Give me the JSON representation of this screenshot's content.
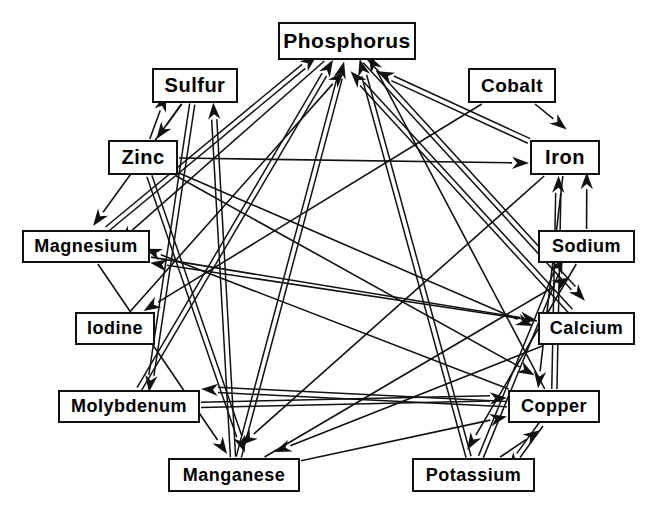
{
  "diagram": {
    "type": "directed-graph",
    "background_color": "#ffffff",
    "line_color": "#111111",
    "box_border_color": "#111111",
    "box_fill_color": "#ffffff"
  },
  "nodes": [
    {
      "id": "phosphorus",
      "label": "Phosphorus",
      "x": 278,
      "y": 22,
      "w": 138,
      "h": 38,
      "font_size": 21
    },
    {
      "id": "sulfur",
      "label": "Sulfur",
      "x": 152,
      "y": 68,
      "w": 86,
      "h": 35,
      "font_size": 20
    },
    {
      "id": "cobalt",
      "label": "Cobalt",
      "x": 468,
      "y": 68,
      "w": 88,
      "h": 35,
      "font_size": 19
    },
    {
      "id": "zinc",
      "label": "Zinc",
      "x": 108,
      "y": 140,
      "w": 70,
      "h": 35,
      "font_size": 20
    },
    {
      "id": "iron",
      "label": "Iron",
      "x": 530,
      "y": 140,
      "w": 70,
      "h": 35,
      "font_size": 20
    },
    {
      "id": "magnesium",
      "label": "Magnesium",
      "x": 22,
      "y": 230,
      "w": 128,
      "h": 33,
      "font_size": 18
    },
    {
      "id": "sodium",
      "label": "Sodium",
      "x": 538,
      "y": 230,
      "w": 97,
      "h": 33,
      "font_size": 18
    },
    {
      "id": "iodine",
      "label": "Iodine",
      "x": 75,
      "y": 312,
      "w": 80,
      "h": 33,
      "font_size": 18
    },
    {
      "id": "calcium",
      "label": "Calcium",
      "x": 538,
      "y": 312,
      "w": 97,
      "h": 33,
      "font_size": 18
    },
    {
      "id": "molybdenum",
      "label": "Molybdenum",
      "x": 58,
      "y": 390,
      "w": 142,
      "h": 33,
      "font_size": 18
    },
    {
      "id": "copper",
      "label": "Copper",
      "x": 508,
      "y": 390,
      "w": 92,
      "h": 33,
      "font_size": 18
    },
    {
      "id": "manganese",
      "label": "Manganese",
      "x": 168,
      "y": 458,
      "w": 132,
      "h": 34,
      "font_size": 18
    },
    {
      "id": "potassium",
      "label": "Potassium",
      "x": 412,
      "y": 458,
      "w": 123,
      "h": 34,
      "font_size": 18
    }
  ],
  "edges": [
    {
      "from": "zinc",
      "to": "sulfur",
      "style": "single"
    },
    {
      "from": "sulfur",
      "to": "zinc",
      "style": "single"
    },
    {
      "from": "manganese",
      "to": "sulfur",
      "style": "double"
    },
    {
      "from": "cobalt",
      "to": "iron",
      "style": "single"
    },
    {
      "from": "copper",
      "to": "iron",
      "style": "double"
    },
    {
      "from": "zinc",
      "to": "iron",
      "style": "single"
    },
    {
      "from": "sodium",
      "to": "iron",
      "style": "single"
    },
    {
      "from": "calcium",
      "to": "phosphorus",
      "style": "double"
    },
    {
      "from": "iron",
      "to": "phosphorus",
      "style": "double"
    },
    {
      "from": "magnesium",
      "to": "phosphorus",
      "style": "double"
    },
    {
      "from": "molybdenum",
      "to": "phosphorus",
      "style": "double"
    },
    {
      "from": "manganese",
      "to": "phosphorus",
      "style": "double"
    },
    {
      "from": "potassium",
      "to": "phosphorus",
      "style": "double"
    },
    {
      "from": "copper",
      "to": "phosphorus",
      "style": "single"
    },
    {
      "from": "iodine",
      "to": "phosphorus",
      "style": "single"
    },
    {
      "from": "phosphorus",
      "to": "magnesium",
      "style": "single"
    },
    {
      "from": "calcium",
      "to": "magnesium",
      "style": "single"
    },
    {
      "from": "sulfur",
      "to": "magnesium",
      "style": "single"
    },
    {
      "from": "copper",
      "to": "magnesium",
      "style": "single"
    },
    {
      "from": "cobalt",
      "to": "iodine",
      "style": "single"
    },
    {
      "from": "sulfur",
      "to": "molybdenum",
      "style": "double"
    },
    {
      "from": "copper",
      "to": "molybdenum",
      "style": "double"
    },
    {
      "from": "zinc",
      "to": "manganese",
      "style": "double"
    },
    {
      "from": "magnesium",
      "to": "manganese",
      "style": "single"
    },
    {
      "from": "calcium",
      "to": "manganese",
      "style": "single"
    },
    {
      "from": "iron",
      "to": "manganese",
      "style": "single"
    },
    {
      "from": "copper",
      "to": "potassium",
      "style": "double"
    },
    {
      "from": "sodium",
      "to": "potassium",
      "style": "single"
    },
    {
      "from": "zinc",
      "to": "copper",
      "style": "single"
    },
    {
      "from": "molybdenum",
      "to": "copper",
      "style": "double"
    },
    {
      "from": "manganese",
      "to": "copper",
      "style": "single"
    },
    {
      "from": "potassium",
      "to": "copper",
      "style": "single"
    },
    {
      "from": "iron",
      "to": "copper",
      "style": "single"
    },
    {
      "from": "phosphorus",
      "to": "calcium",
      "style": "double"
    },
    {
      "from": "magnesium",
      "to": "calcium",
      "style": "single"
    },
    {
      "from": "zinc",
      "to": "calcium",
      "style": "single"
    },
    {
      "from": "potassium",
      "to": "sodium",
      "style": "double"
    },
    {
      "from": "manganese",
      "to": "sodium",
      "style": "single"
    }
  ]
}
